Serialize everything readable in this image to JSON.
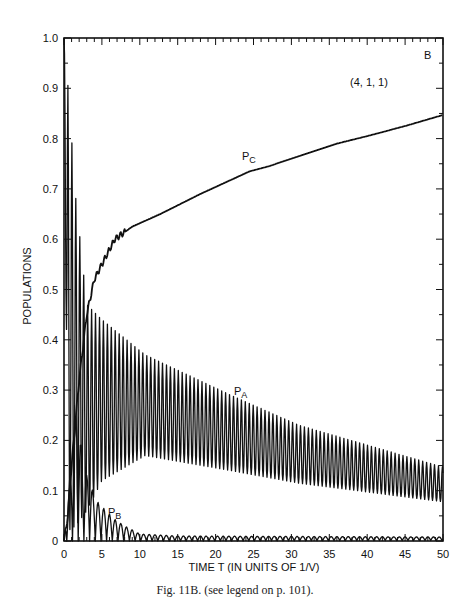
{
  "chart_data": {
    "type": "line",
    "title": "",
    "panel_label": "B",
    "annotation": "(4, 1, 1)",
    "xlabel": "TIME T (IN UNITS OF 1/V)",
    "ylabel": "POPULATIONS",
    "xlim": [
      0,
      50
    ],
    "ylim": [
      0,
      1.0
    ],
    "xticks": [
      "0",
      "5",
      "10",
      "15",
      "20",
      "25",
      "30",
      "35",
      "40",
      "45",
      "50"
    ],
    "yticks": [
      "0",
      "0.1",
      "0.2",
      "0.3",
      "0.4",
      "0.5",
      "0.6",
      "0.7",
      "0.8",
      "0.9",
      "1.0"
    ],
    "grid": false,
    "series": [
      {
        "name": "P_C",
        "label_main": "P",
        "label_sub": "C",
        "style": "smooth",
        "x": [
          0,
          0.5,
          1,
          2,
          3,
          4,
          5,
          6.7,
          9,
          12.7,
          18,
          24.5,
          27,
          31,
          36,
          40,
          45,
          50
        ],
        "y": [
          0,
          0.05,
          0.15,
          0.32,
          0.45,
          0.52,
          0.55,
          0.6,
          0.625,
          0.65,
          0.69,
          0.735,
          0.745,
          0.765,
          0.79,
          0.805,
          0.825,
          0.847
        ]
      },
      {
        "name": "P_A",
        "label_main": "P",
        "label_sub": "A",
        "style": "oscillating",
        "peaks_x": [
          0,
          0.5,
          1.5,
          3,
          5,
          10.7,
          22,
          31,
          50
        ],
        "upper_envelope": [
          1.0,
          0.91,
          0.69,
          0.47,
          0.44,
          0.37,
          0.29,
          0.23,
          0.147
        ],
        "lower_envelope": [
          1.0,
          0.02,
          0.03,
          0.06,
          0.12,
          0.17,
          0.14,
          0.115,
          0.078
        ],
        "period": 0.52
      },
      {
        "name": "P_B",
        "label_main": "P",
        "label_sub": "B",
        "style": "oscillating",
        "peaks_x": [
          0,
          1.7,
          2.5,
          4.3,
          6.5,
          8,
          10,
          15,
          50
        ],
        "upper_envelope": [
          0,
          0.28,
          0.15,
          0.08,
          0.045,
          0.03,
          0.014,
          0.01,
          0.008
        ],
        "lower_envelope": [
          0,
          0,
          0,
          0,
          0,
          0,
          0,
          0,
          0.001
        ],
        "period": 0.75
      }
    ]
  },
  "caption": "Fig. 11B.   (see legend on p. 101)."
}
